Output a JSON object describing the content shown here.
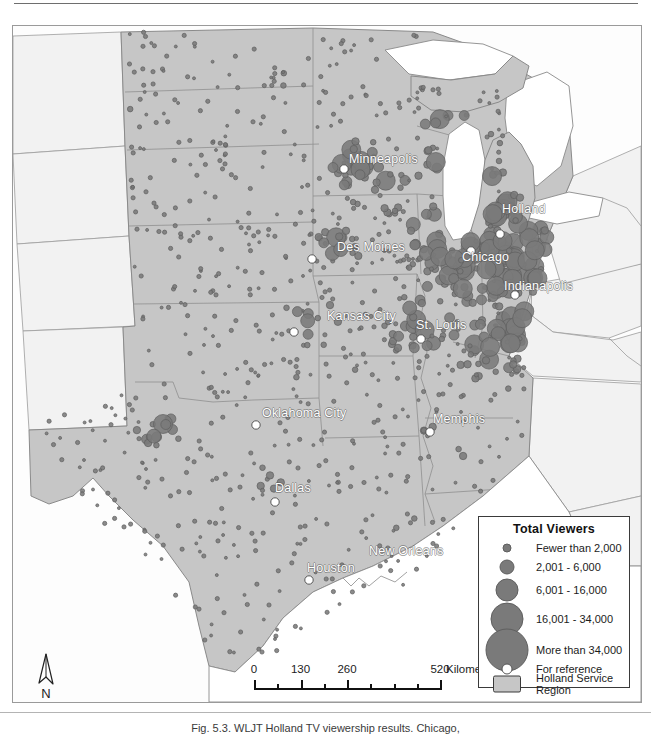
{
  "figure": {
    "caption": "Fig. 5.3. WLJT Holland TV viewership results. Chicago,",
    "has_top_rule": true,
    "has_bottom_rule": true
  },
  "map": {
    "title": "Holland Service Region Total Viewers Map",
    "colors": {
      "service_region_fill": "#c6c6c6",
      "outside_region_fill": "#f2f2f2",
      "water_fill": "#ffffff",
      "boundary_stroke": "#8c8c8c",
      "dot_fill": "#7a7a7a",
      "dot_stroke": "#5f5f5f",
      "reference_city_fill": "#ffffff",
      "frame_stroke": "#9a9a9a",
      "label_color": "#ffffff"
    },
    "city_labels": [
      {
        "name": "Minneapolis",
        "label": "Minneapolis",
        "x": 336,
        "y": 126
      },
      {
        "name": "Holland",
        "label": "Holland",
        "x": 489,
        "y": 176
      },
      {
        "name": "Des Moines",
        "label": "Des Moines",
        "x": 324,
        "y": 214
      },
      {
        "name": "Chicago",
        "label": "Chicago",
        "x": 449,
        "y": 224
      },
      {
        "name": "Indianapolis",
        "label": "Indianapolis",
        "x": 491,
        "y": 253
      },
      {
        "name": "Kansas City",
        "label": "Kansas City",
        "x": 314,
        "y": 283
      },
      {
        "name": "St. Louis",
        "label": "St. Louis",
        "x": 403,
        "y": 292
      },
      {
        "name": "Oklahoma City",
        "label": "Oklahoma City",
        "x": 249,
        "y": 380
      },
      {
        "name": "Memphis",
        "label": "Memphis",
        "x": 420,
        "y": 386
      },
      {
        "name": "Dallas",
        "label": "Dallas",
        "x": 262,
        "y": 455
      },
      {
        "name": "New Orleans",
        "label": "New Orleans",
        "x": 356,
        "y": 518
      },
      {
        "name": "Houston",
        "label": "Houston",
        "x": 294,
        "y": 535
      }
    ]
  },
  "legend": {
    "title": "Total Viewers",
    "entries": [
      {
        "symbol": "dot",
        "size": 7,
        "label": "Fewer than 2,000"
      },
      {
        "symbol": "dot",
        "size": 13,
        "label": "2,001 - 6,000"
      },
      {
        "symbol": "dot",
        "size": 21,
        "label": "6,001 - 16,000"
      },
      {
        "symbol": "dot",
        "size": 31,
        "label": "16,001 - 34,000"
      },
      {
        "symbol": "dot",
        "size": 41,
        "label": "More than 34,000"
      },
      {
        "symbol": "ring",
        "size": 9,
        "label": "For reference"
      },
      {
        "symbol": "swatch",
        "size": 0,
        "label": "Holland Service\nRegion"
      }
    ]
  },
  "scale_bar": {
    "unit_label": "Kilometers",
    "tick_labels": [
      "0",
      "130",
      "260",
      "520"
    ],
    "tick_values": [
      0,
      130,
      260,
      520
    ],
    "max_value": 520,
    "divisions": 8
  },
  "north_arrow": {
    "label": "N"
  }
}
